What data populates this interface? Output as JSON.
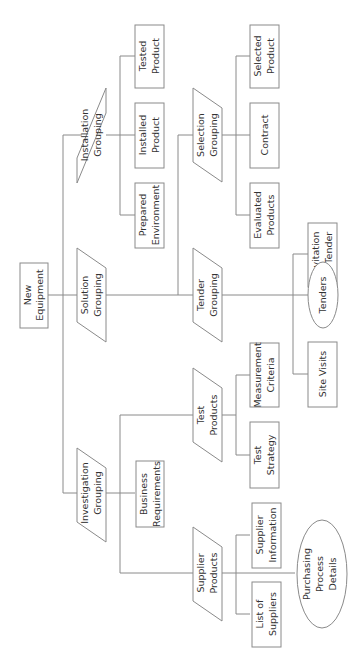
{
  "diagram": {
    "orientation": "rotated-90-ccw",
    "root": {
      "id": "new-equipment",
      "label": [
        "New",
        "Equipment"
      ],
      "shape": "rect"
    },
    "groupings": [
      {
        "id": "installation-grouping",
        "label": [
          "Installation",
          "Grouping"
        ],
        "shape": "parallelogram"
      },
      {
        "id": "solution-grouping",
        "label": [
          "Solution",
          "Grouping"
        ],
        "shape": "parallelogram"
      },
      {
        "id": "investigation-grouping",
        "label": [
          "Investigation",
          "Grouping"
        ],
        "shape": "parallelogram"
      },
      {
        "id": "selection-grouping",
        "label": [
          "Selection",
          "Grouping"
        ],
        "shape": "parallelogram"
      },
      {
        "id": "tender-grouping",
        "label": [
          "Tender",
          "Grouping"
        ],
        "shape": "parallelogram"
      },
      {
        "id": "test-products",
        "label": [
          "Test",
          "Products"
        ],
        "shape": "parallelogram"
      },
      {
        "id": "supplier-products",
        "label": [
          "Supplier",
          "Products"
        ],
        "shape": "parallelogram"
      }
    ],
    "products": [
      {
        "id": "tested-product",
        "label": [
          "Tested",
          "Product"
        ],
        "shape": "rect"
      },
      {
        "id": "installed-product",
        "label": [
          "Installed",
          "Product"
        ],
        "shape": "rect"
      },
      {
        "id": "prepared-environment",
        "label": [
          "Prepared",
          "Environment"
        ],
        "shape": "rect"
      },
      {
        "id": "selected-product",
        "label": [
          "Selected",
          "Product"
        ],
        "shape": "rect"
      },
      {
        "id": "contract",
        "label": [
          "Contract"
        ],
        "shape": "rect"
      },
      {
        "id": "evaluated-products",
        "label": [
          "Evaluated",
          "Products"
        ],
        "shape": "rect"
      },
      {
        "id": "invitation-to-tender",
        "label": [
          "Invitation",
          "to Tender"
        ],
        "shape": "rect"
      },
      {
        "id": "tenders",
        "label": [
          "Tenders"
        ],
        "shape": "ellipse"
      },
      {
        "id": "site-visits",
        "label": [
          "Site Visits"
        ],
        "shape": "rect"
      },
      {
        "id": "measurement-criteria",
        "label": [
          "Measurement",
          "Criteria"
        ],
        "shape": "rect"
      },
      {
        "id": "test-strategy",
        "label": [
          "Test",
          "Strategy"
        ],
        "shape": "rect"
      },
      {
        "id": "business-requirements",
        "label": [
          "Business",
          "Requirements"
        ],
        "shape": "rect"
      },
      {
        "id": "supplier-information",
        "label": [
          "Supplier",
          "Information"
        ],
        "shape": "rect"
      },
      {
        "id": "list-of-suppliers",
        "label": [
          "List of",
          "Suppliers"
        ],
        "shape": "rect"
      },
      {
        "id": "purchasing-process-details",
        "label": [
          "Purchasing",
          "Process",
          "Details"
        ],
        "shape": "ellipse"
      }
    ],
    "edges": [
      [
        "new-equipment",
        "installation-grouping"
      ],
      [
        "new-equipment",
        "solution-grouping"
      ],
      [
        "new-equipment",
        "investigation-grouping"
      ],
      [
        "installation-grouping",
        "tested-product"
      ],
      [
        "installation-grouping",
        "installed-product"
      ],
      [
        "installation-grouping",
        "prepared-environment"
      ],
      [
        "solution-grouping",
        "selection-grouping"
      ],
      [
        "solution-grouping",
        "tender-grouping"
      ],
      [
        "selection-grouping",
        "selected-product"
      ],
      [
        "selection-grouping",
        "contract"
      ],
      [
        "selection-grouping",
        "evaluated-products"
      ],
      [
        "tender-grouping",
        "invitation-to-tender"
      ],
      [
        "tender-grouping",
        "tenders"
      ],
      [
        "tender-grouping",
        "site-visits"
      ],
      [
        "investigation-grouping",
        "test-products"
      ],
      [
        "investigation-grouping",
        "business-requirements"
      ],
      [
        "investigation-grouping",
        "supplier-products"
      ],
      [
        "test-products",
        "measurement-criteria"
      ],
      [
        "test-products",
        "test-strategy"
      ],
      [
        "supplier-products",
        "supplier-information"
      ],
      [
        "supplier-products",
        "list-of-suppliers"
      ],
      [
        "supplier-products",
        "purchasing-process-details"
      ]
    ]
  },
  "labels": {
    "new_equipment_1": "New",
    "new_equipment_2": "Equipment",
    "installation_1": "Installation",
    "installation_2": "Grouping",
    "solution_1": "Solution",
    "solution_2": "Grouping",
    "investigation_1": "Investigation",
    "investigation_2": "Grouping",
    "tested_1": "Tested",
    "tested_2": "Product",
    "installed_1": "Installed",
    "installed_2": "Product",
    "prepared_1": "Prepared",
    "prepared_2": "Environment",
    "business_1": "Business",
    "business_2": "Requirements",
    "selection_1": "Selection",
    "selection_2": "Grouping",
    "tender_1": "Tender",
    "tender_2": "Grouping",
    "test_products_1": "Test",
    "test_products_2": "Products",
    "supplier_products_1": "Supplier",
    "supplier_products_2": "Products",
    "selected_1": "Selected",
    "selected_2": "Product",
    "contract": "Contract",
    "evaluated_1": "Evaluated",
    "evaluated_2": "Products",
    "invitation_1": "Invitation",
    "invitation_2": "to Tender",
    "tenders": "Tenders",
    "site_visits": "Site Visits",
    "measurement_1": "Measurement",
    "measurement_2": "Criteria",
    "test_strategy_1": "Test",
    "test_strategy_2": "Strategy",
    "supplier_info_1": "Supplier",
    "supplier_info_2": "Information",
    "list_suppliers_1": "List of",
    "list_suppliers_2": "Suppliers",
    "purchasing_1": "Purchasing",
    "purchasing_2": "Process",
    "purchasing_3": "Details"
  }
}
